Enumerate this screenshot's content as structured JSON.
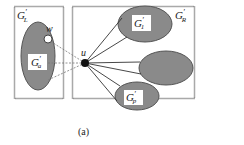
{
  "figure": {
    "caption": "(a)",
    "colors": {
      "box_border": "#555555",
      "ellipse_fill": "#8a8a8a",
      "ellipse_stroke": "#555555",
      "node_u": "#111111",
      "node_w": "#ffffff",
      "edge": "#333333",
      "dashed_edge": "#777777",
      "label_bg": "#ffffff"
    }
  },
  "left_box": {
    "label_main": "G",
    "label_prime": "′",
    "label_sub": "L",
    "subgraph": {
      "label_main": "G",
      "label_prime": "′",
      "label_sub": "a"
    },
    "node_w": "w"
  },
  "right_box": {
    "label_main": "G",
    "label_prime": "′",
    "label_sub": "R",
    "subgraphs": [
      {
        "label_main": "G",
        "label_prime": "′",
        "label_sub": "1"
      },
      {
        "label_main": "",
        "label_prime": "",
        "label_sub": ""
      },
      {
        "label_main": "G",
        "label_prime": "′",
        "label_sub": "p"
      }
    ]
  },
  "node_u": "u"
}
